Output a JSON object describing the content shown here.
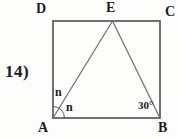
{
  "figure": {
    "problem_number": "14)",
    "vertices": {
      "top_left": "D",
      "top_mid": "E",
      "top_right": "C",
      "bottom_left": "A",
      "bottom_right": "B"
    },
    "angles": {
      "at_A_upper": "n",
      "at_A_lower": "n",
      "at_B": "30°"
    },
    "colors": {
      "outline": "#59595b",
      "segment": "#6c6c6e",
      "text": "#1c1c1c",
      "background": "#fdfdfc"
    }
  }
}
